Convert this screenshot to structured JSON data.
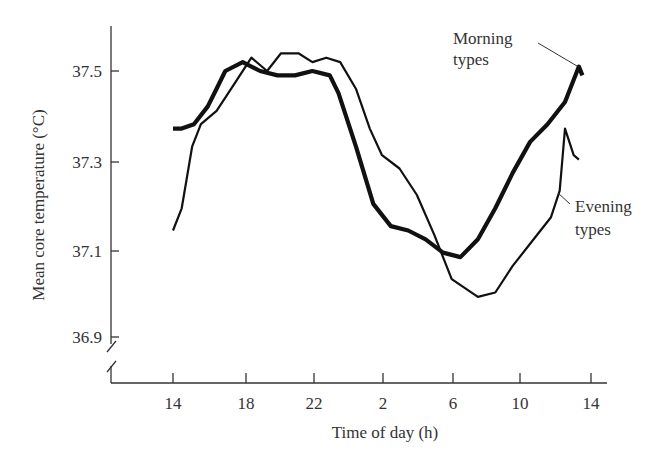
{
  "chart_data": {
    "type": "line",
    "title": "",
    "xlabel": "Time of day (h)",
    "ylabel": "Mean core temperature (°C)",
    "x_ticks": [
      "14",
      "18",
      "22",
      "2",
      "6",
      "10",
      "14"
    ],
    "y_ticks": [
      "36.9",
      "37.1",
      "37.3",
      "37.5"
    ],
    "ylim": [
      36.9,
      37.6
    ],
    "x_range_hours_from_14": [
      0,
      24
    ],
    "axis_break": "y-axis broken below 36.9",
    "grid": false,
    "legend": "inline annotations",
    "series": [
      {
        "name": "Morning types",
        "style": "thick",
        "x_hours": [
          14,
          14.5,
          15.2,
          16,
          16.5,
          17,
          18,
          18.5,
          19,
          20,
          21,
          22,
          23,
          23.5,
          24.5,
          25.5,
          26.5,
          27.5,
          28.5,
          29.5,
          30.5,
          31.5,
          32.5,
          33.5,
          34.5,
          35.5,
          36.5,
          37.3,
          37.5
        ],
        "values": [
          37.37,
          37.37,
          37.38,
          37.42,
          37.46,
          37.5,
          37.52,
          37.51,
          37.5,
          37.49,
          37.49,
          37.5,
          37.49,
          37.45,
          37.33,
          37.2,
          37.15,
          37.14,
          37.12,
          37.09,
          37.08,
          37.12,
          37.19,
          37.27,
          37.34,
          37.38,
          37.43,
          37.51,
          37.49
        ]
      },
      {
        "name": "Evening types",
        "style": "thin",
        "x_hours": [
          14,
          14.5,
          15.1,
          15.6,
          16.5,
          17.5,
          18.5,
          19.4,
          20.2,
          21.2,
          22,
          22.8,
          23.6,
          24.5,
          25.3,
          26,
          27,
          28,
          29,
          30,
          31.5,
          32.5,
          33.5,
          34.5,
          35.7,
          36.2,
          36.5,
          37,
          37.3
        ],
        "values": [
          37.14,
          37.19,
          37.33,
          37.38,
          37.41,
          37.47,
          37.53,
          37.5,
          37.54,
          37.54,
          37.52,
          37.53,
          37.52,
          37.46,
          37.37,
          37.31,
          37.28,
          37.22,
          37.13,
          37.03,
          36.99,
          37.0,
          37.06,
          37.11,
          37.17,
          37.23,
          37.37,
          37.31,
          37.3
        ]
      }
    ],
    "annotations": [
      {
        "text_lines": [
          "Morning",
          "types"
        ],
        "points_to": "Morning types"
      },
      {
        "text_lines": [
          "Evening",
          "types"
        ],
        "points_to": "Evening types"
      }
    ]
  },
  "labels": {
    "xlabel": "Time of day (h)",
    "ylabel": "Mean core temperature (°C)",
    "morning_line1": "Morning",
    "morning_line2": "types",
    "evening_line1": "Evening",
    "evening_line2": "types",
    "x_ticks": [
      "14",
      "18",
      "22",
      "2",
      "6",
      "10",
      "14"
    ],
    "y_ticks": [
      "37.5",
      "37.3",
      "37.1",
      "36.9"
    ]
  }
}
